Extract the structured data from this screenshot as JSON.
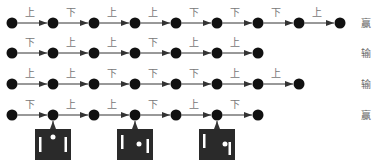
{
  "colors": {
    "node": "#111111",
    "edge": "#333333",
    "screen": "#2a2a2a",
    "screen_item": "#ffffff"
  },
  "sequences": [
    {
      "moves": [
        "上",
        "下",
        "上",
        "上",
        "下",
        "下",
        "下",
        "上"
      ],
      "result": "赢"
    },
    {
      "moves": [
        "下",
        "上",
        "上",
        "下",
        "上",
        "上"
      ],
      "result": "输"
    },
    {
      "moves": [
        "上",
        "上",
        "下",
        "下",
        "下",
        "上",
        "上"
      ],
      "result": "输"
    },
    {
      "moves": [
        "下",
        "上",
        "上",
        "下",
        "上",
        "下"
      ],
      "result": "赢"
    }
  ],
  "screens": [
    {
      "attached_to_row": 3,
      "attached_to_node": 1,
      "ball": "top-center",
      "icon": "pong-screen-icon"
    },
    {
      "attached_to_row": 3,
      "attached_to_node": 3,
      "ball": "center-right",
      "icon": "pong-screen-icon"
    },
    {
      "attached_to_row": 3,
      "attached_to_node": 5,
      "ball": "right",
      "icon": "pong-screen-icon"
    }
  ]
}
